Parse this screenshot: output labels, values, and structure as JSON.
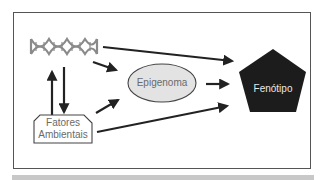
{
  "diagram": {
    "nodes": {
      "dna": {
        "label": "",
        "icon": "dna-helix-icon"
      },
      "environment": {
        "label_line1": "Fatores",
        "label_line2": "Ambientais"
      },
      "epigenome": {
        "label": "Epigenoma"
      },
      "phenotype": {
        "label": "Fenótipo"
      }
    },
    "edges": [
      {
        "from": "dna",
        "to": "phenotype"
      },
      {
        "from": "dna",
        "to": "epigenome"
      },
      {
        "from": "dna",
        "to": "environment",
        "bidirectional": true
      },
      {
        "from": "environment",
        "to": "epigenome"
      },
      {
        "from": "environment",
        "to": "phenotype"
      },
      {
        "from": "epigenome",
        "to": "phenotype"
      }
    ],
    "colors": {
      "frame": "#555555",
      "dna": "#8a8a8a",
      "arrow": "#222222",
      "epigenome_fill": "#e3e3e3",
      "phenotype_fill": "#1c1c1c",
      "label_text": "#6a6a6a"
    }
  }
}
